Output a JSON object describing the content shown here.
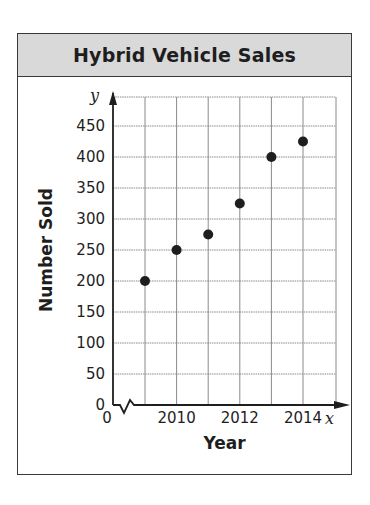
{
  "title": "Hybrid Vehicle Sales",
  "chart_data": {
    "type": "scatter",
    "title": "Hybrid Vehicle Sales",
    "xlabel": "Year",
    "ylabel": "Number Sold",
    "x_axis_var": "x",
    "y_axis_var": "y",
    "x": [
      2009,
      2010,
      2011,
      2012,
      2013,
      2014
    ],
    "y": [
      200,
      250,
      275,
      325,
      400,
      425
    ],
    "x_ticks": [
      "0",
      "2010",
      "2012",
      "2014"
    ],
    "y_ticks": [
      "0",
      "50",
      "100",
      "150",
      "200",
      "250",
      "300",
      "350",
      "400",
      "450"
    ],
    "ylim": [
      0,
      475
    ],
    "xlim": [
      2008,
      2015
    ],
    "grid": true,
    "axis_break": "x-axis break between 0 and 2009",
    "marker_color": "#1e1e1e"
  }
}
